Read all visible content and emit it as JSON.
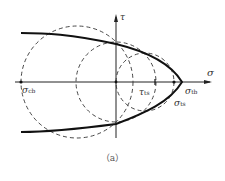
{
  "diagram": {
    "axes": {
      "x_label": "σ",
      "y_label": "τ"
    },
    "labels": {
      "sigma_cb": {
        "main": "σ",
        "sub": "cb"
      },
      "tau_ts": {
        "main": "τ",
        "sub": "ts"
      },
      "sigma_tb": {
        "main": "σ",
        "sub": "tb"
      },
      "sigma_ts": {
        "main": "σ",
        "sub": "ts"
      }
    },
    "caption": "（a）",
    "colors": {
      "line": "#1a1a1a",
      "dashed": "#333333"
    }
  }
}
